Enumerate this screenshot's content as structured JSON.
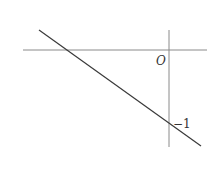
{
  "diagram": {
    "type": "coordinate-graph",
    "origin_label": "O",
    "y_intercept_label": "−1",
    "line": {
      "description": "decreasing straight line crossing the negative x-axis and the y-axis at -1"
    },
    "colors": {
      "axes": "#8a8a8a",
      "line": "#3a3a3a",
      "text": "#333333"
    }
  }
}
